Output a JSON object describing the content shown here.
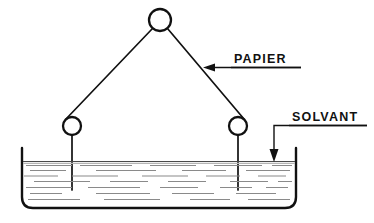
{
  "figure": {
    "background_color": "#ffffff",
    "ink_color": "#111111",
    "liquid_line_color": "#8a8a8a",
    "width": 374,
    "height": 223
  },
  "labels": [
    {
      "id": "papier",
      "text": "PAPIER",
      "x": 234,
      "y": 63,
      "underline": {
        "x1": 231,
        "x2": 300,
        "y": 67
      },
      "leader": {
        "type": "arrow-left",
        "x_from": 300,
        "x_to": 204,
        "y": 67
      }
    },
    {
      "id": "solvant",
      "text": "SOLVANT",
      "x": 292,
      "y": 121,
      "underline": {
        "x1": 289,
        "x2": 366,
        "y": 125
      },
      "leader": {
        "type": "elbow-down-arrow",
        "x_from": 366,
        "x_elbow": 274,
        "y_top": 125,
        "y_to": 161
      }
    }
  ],
  "pulleys": [
    {
      "id": "top-pulley",
      "cx": 160,
      "cy": 20,
      "r": 11
    },
    {
      "id": "left-pulley",
      "cx": 72,
      "cy": 126,
      "r": 9
    },
    {
      "id": "right-pulley",
      "cx": 238,
      "cy": 126,
      "r": 9
    }
  ],
  "paper_strip": {
    "description": "Bande de papier tendue sur trois poulies, plongeant dans le solvant",
    "left_descent": {
      "x": 72,
      "y_top": 135,
      "y_bottom": 190
    },
    "right_descent": {
      "x": 238,
      "y_top": 135,
      "y_bottom": 190
    },
    "left_diagonal": {
      "x1": 66,
      "y1": 118,
      "x2": 153,
      "y2": 28
    },
    "right_diagonal": {
      "x1": 167,
      "y1": 28,
      "x2": 244,
      "y2": 118
    }
  },
  "vessel": {
    "id": "solvent-tank",
    "left_x": 22,
    "right_x": 296,
    "top_y": 148,
    "bottom_y": 208,
    "corner_radius": 11,
    "liquid_surface_y": 161
  },
  "liquid_lines": [
    {
      "y": 161,
      "segments": [
        [
          24,
          294
        ]
      ]
    },
    {
      "y": 165,
      "segments": [
        [
          26,
          72
        ],
        [
          80,
          132
        ],
        [
          150,
          196
        ],
        [
          214,
          262
        ],
        [
          272,
          292
        ]
      ]
    },
    {
      "y": 170,
      "segments": [
        [
          30,
          66
        ],
        [
          96,
          156
        ],
        [
          182,
          226
        ],
        [
          246,
          290
        ]
      ]
    },
    {
      "y": 176,
      "segments": [
        [
          24,
          58
        ],
        [
          72,
          118
        ],
        [
          142,
          188
        ],
        [
          206,
          240
        ],
        [
          258,
          286
        ]
      ]
    },
    {
      "y": 181,
      "segments": [
        [
          34,
          90
        ],
        [
          110,
          148
        ],
        [
          168,
          206
        ],
        [
          230,
          268
        ],
        [
          278,
          292
        ]
      ]
    },
    {
      "y": 187,
      "segments": [
        [
          26,
          72
        ],
        [
          88,
          140
        ],
        [
          160,
          198
        ],
        [
          220,
          252
        ],
        [
          266,
          288
        ]
      ]
    },
    {
      "y": 193,
      "segments": [
        [
          30,
          62
        ],
        [
          96,
          150
        ],
        [
          172,
          214
        ],
        [
          236,
          276
        ]
      ]
    },
    {
      "y": 199,
      "segments": [
        [
          28,
          80
        ],
        [
          104,
          160
        ],
        [
          190,
          230
        ],
        [
          248,
          290
        ]
      ]
    }
  ],
  "icons": {
    "arrow_head": "triangle-arrow-head",
    "pulley": "circle-pulley"
  }
}
